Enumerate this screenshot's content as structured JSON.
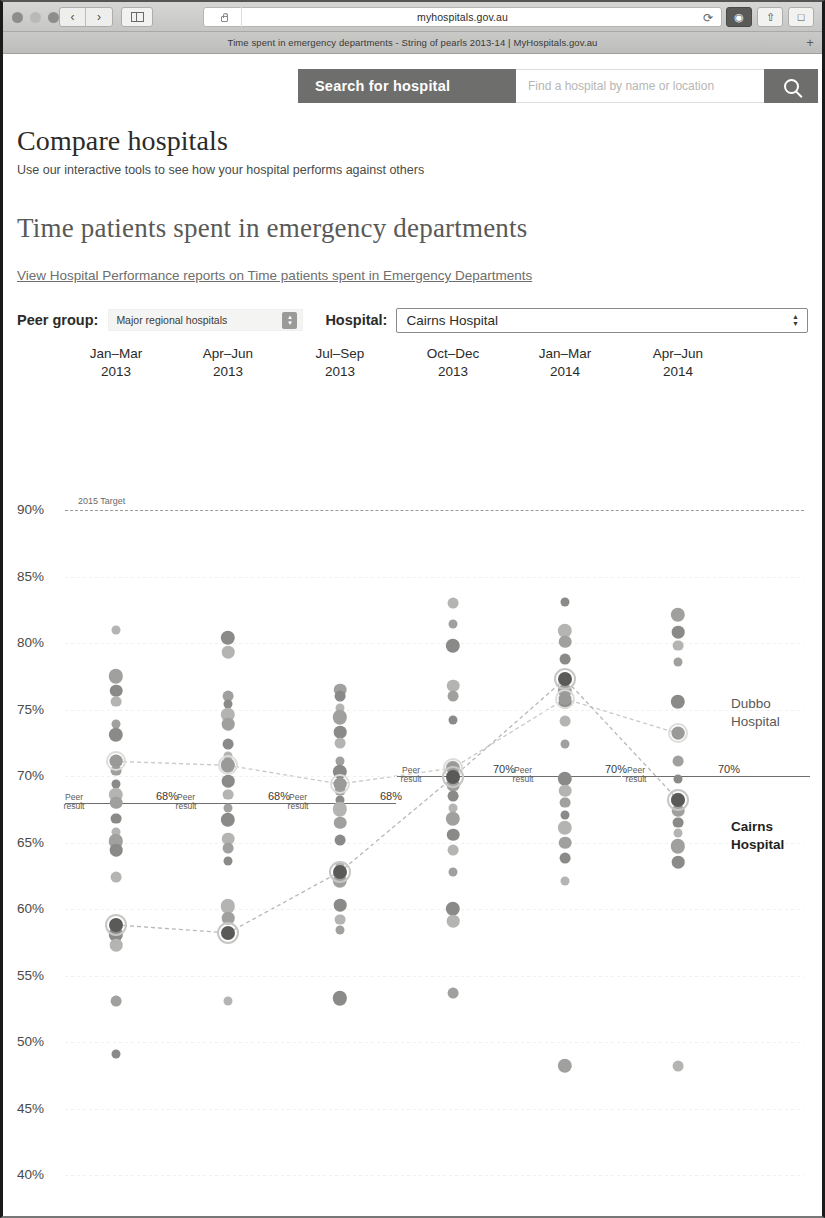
{
  "browser": {
    "url": "myhospitals.gov.au",
    "tab_title": "Time spent in emergency departments - String of pearls 2013-14 | MyHospitals.gov.au",
    "back_icon": "chevron-left-icon",
    "forward_icon": "chevron-right-icon",
    "sidebar_icon": "sidebar-icon",
    "lock_icon": "lock-icon",
    "reload_icon": "reload-icon",
    "new_tab_icon": "plus-icon"
  },
  "search": {
    "label": "Search for hospital",
    "placeholder": "Find a hospital by name or location",
    "button_icon": "search-icon"
  },
  "header": {
    "title": "Compare hospitals",
    "subtitle": "Use our interactive tools to see how your hospital performs against others",
    "page_title": "Time patients spent in emergency departments",
    "report_link": "View Hospital Performance reports on Time patients spent in Emergency Departments"
  },
  "filters": {
    "peer_group_label": "Peer group:",
    "peer_group_value": "Major regional hospitals",
    "hospital_label": "Hospital:",
    "hospital_value": "Cairns Hospital"
  },
  "colors": {
    "accent": "#6e6e6c",
    "highlight_dark": "#1f1f1d",
    "dot_grey": "#b4b4b2",
    "dot_dark": "#8a8a88",
    "peer_line": "#6e6e6c",
    "target_line": "#9a9a98"
  },
  "chart_data": {
    "type": "scatter",
    "title": "Time patients spent in emergency departments",
    "xlabel": "",
    "ylabel": "",
    "ylim": [
      40,
      90
    ],
    "yticks": [
      90,
      85,
      80,
      75,
      70,
      65,
      60,
      55,
      50,
      45,
      40
    ],
    "ytick_labels": [
      "90%",
      "85%",
      "80%",
      "75%",
      "70%",
      "65%",
      "60%",
      "55%",
      "50%",
      "45%",
      "40%"
    ],
    "grid": true,
    "legend_position": "right",
    "categories": [
      "Jan–Mar 2013",
      "Apr–Jun 2013",
      "Jul–Sep 2013",
      "Oct–Dec 2013",
      "Jan–Mar 2014",
      "Apr–Jun 2014"
    ],
    "category_lines": [
      [
        "Jan–Mar",
        "2013"
      ],
      [
        "Apr–Jun",
        "2013"
      ],
      [
        "Jul–Sep",
        "2013"
      ],
      [
        "Oct–Dec",
        "2013"
      ],
      [
        "Jan–Mar",
        "2014"
      ],
      [
        "Apr–Jun",
        "2014"
      ]
    ],
    "target": {
      "value": 90,
      "label": "2015 Target",
      "style": "dashed"
    },
    "peer_result": {
      "label": "Peer result",
      "values": [
        68,
        68,
        68,
        70,
        70,
        70
      ],
      "value_labels": [
        "68%",
        "68%",
        "68%",
        "70%",
        "70%",
        "70%"
      ]
    },
    "series": [
      {
        "name": "Dubbo Hospital",
        "highlight": "light",
        "values": [
          71.1,
          70.8,
          69.4,
          70.6,
          75.8,
          73.2
        ]
      },
      {
        "name": "Cairns Hospital",
        "highlight": "bold",
        "values": [
          58.8,
          58.2,
          62.8,
          69.9,
          77.3,
          68.2
        ]
      }
    ],
    "peer_points": [
      {
        "category": 0,
        "values": [
          81.0,
          77.5,
          76.4,
          75.6,
          73.9,
          73.1,
          71.1,
          70.4,
          69.4,
          68.6,
          68.0,
          66.8,
          65.8,
          65.1,
          64.4,
          62.4,
          58.8,
          58.1,
          57.3,
          53.1,
          49.1
        ]
      },
      {
        "category": 1,
        "values": [
          80.4,
          79.3,
          76.0,
          75.4,
          74.6,
          73.9,
          72.4,
          71.5,
          70.8,
          69.6,
          68.6,
          67.6,
          66.7,
          65.3,
          64.6,
          63.6,
          60.2,
          59.3,
          58.2,
          53.1
        ]
      },
      {
        "category": 2,
        "values": [
          76.5,
          76.0,
          75.1,
          74.4,
          73.3,
          72.5,
          71.1,
          70.3,
          69.4,
          68.9,
          68.2,
          67.5,
          66.5,
          65.2,
          63.2,
          62.1,
          60.3,
          59.2,
          58.4,
          53.3
        ]
      },
      {
        "category": 3,
        "values": [
          83.0,
          81.4,
          79.8,
          76.8,
          76.0,
          74.2,
          70.6,
          69.3,
          68.5,
          67.6,
          66.8,
          65.6,
          64.4,
          62.8,
          60.0,
          59.1,
          53.7
        ]
      },
      {
        "category": 4,
        "values": [
          83.1,
          80.9,
          80.1,
          78.8,
          77.3,
          76.4,
          75.5,
          74.1,
          72.4,
          69.8,
          68.9,
          68.0,
          67.1,
          66.1,
          65.0,
          63.8,
          62.1,
          48.2
        ]
      },
      {
        "category": 5,
        "values": [
          82.1,
          80.8,
          79.8,
          78.6,
          75.6,
          73.2,
          71.1,
          69.8,
          68.2,
          67.4,
          66.5,
          65.7,
          64.7,
          63.5,
          48.2
        ]
      }
    ]
  }
}
